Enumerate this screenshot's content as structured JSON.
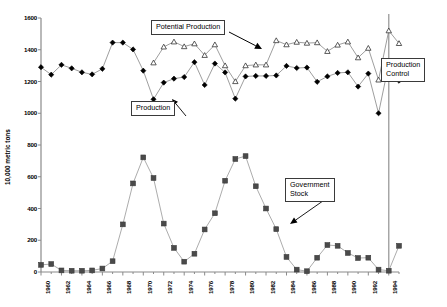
{
  "chart_data": {
    "type": "line",
    "title": "",
    "xlabel": "",
    "ylabel": "10,000 metric tons",
    "ylim": [
      0,
      1600
    ],
    "ytick_step": 200,
    "yticks": [
      0,
      200,
      400,
      600,
      800,
      1000,
      1200,
      1400,
      1600
    ],
    "xlim": [
      1960,
      1995
    ],
    "xticks": [
      1960,
      1962,
      1964,
      1966,
      1968,
      1970,
      1972,
      1974,
      1976,
      1978,
      1980,
      1982,
      1984,
      1986,
      1988,
      1990,
      1992,
      1994
    ],
    "x": [
      1960,
      1961,
      1962,
      1963,
      1964,
      1965,
      1966,
      1967,
      1968,
      1969,
      1970,
      1971,
      1972,
      1973,
      1974,
      1975,
      1976,
      1977,
      1978,
      1979,
      1980,
      1981,
      1982,
      1983,
      1984,
      1985,
      1986,
      1987,
      1988,
      1989,
      1990,
      1991,
      1992,
      1993,
      1994,
      1995
    ],
    "grid": false,
    "legend_position": "none",
    "series": [
      {
        "name": "Production",
        "marker": "filled-diamond",
        "color": "#000000",
        "values": [
          1290,
          1243,
          1305,
          1283,
          1258,
          1245,
          1280,
          1445,
          1445,
          1402,
          1268,
          1088,
          1193,
          1218,
          1228,
          1322,
          1178,
          1313,
          1257,
          1092,
          1232,
          1235,
          1235,
          1238,
          1298,
          1285,
          1288,
          1198,
          1232,
          1254,
          1258,
          1168,
          1250,
          1000,
          1310,
          1205
        ]
      },
      {
        "name": "Potential Production",
        "marker": "open-triangle",
        "color": "#000000",
        "values": [
          null,
          null,
          null,
          null,
          null,
          null,
          null,
          null,
          null,
          null,
          null,
          1318,
          1418,
          1450,
          1420,
          1438,
          1365,
          1432,
          1300,
          1200,
          1300,
          1305,
          1305,
          1458,
          1432,
          1448,
          1442,
          1445,
          1390,
          1430,
          1450,
          1350,
          1410,
          1210,
          1520,
          1440
        ]
      },
      {
        "name": "Government Stock",
        "marker": "filled-square",
        "color": "#404040",
        "values": [
          45,
          50,
          10,
          8,
          8,
          10,
          22,
          68,
          300,
          558,
          722,
          592,
          305,
          152,
          65,
          115,
          268,
          370,
          575,
          712,
          730,
          540,
          400,
          270,
          95,
          15,
          5,
          90,
          170,
          165,
          120,
          88,
          90,
          15,
          8,
          165
        ]
      }
    ],
    "annotations": [
      {
        "name": "potential-production-callout",
        "text": "Potential Production"
      },
      {
        "name": "production-callout",
        "text": "Production"
      },
      {
        "name": "government-stock-callout",
        "text": "Government Stock"
      },
      {
        "name": "production-control-callout",
        "text": "Production\nControl"
      }
    ],
    "production_control_line_year": 1994
  },
  "callouts": {
    "potential_production": "Potential Production",
    "production": "Production",
    "government_stock_line1": "Government",
    "government_stock_line2": "Stock",
    "production_control_line1": "Production",
    "production_control_line2": "Control"
  },
  "axis": {
    "ylabel": "10,000 metric tons"
  }
}
